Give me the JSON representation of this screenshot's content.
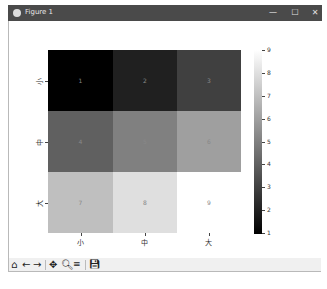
{
  "window": {
    "title": "Figure 1",
    "controls": {
      "minimize": "—",
      "maximize": "☐",
      "close": "✕"
    }
  },
  "chart_data": {
    "type": "heatmap",
    "title": "",
    "x_tick_labels": [
      "小",
      "中",
      "大"
    ],
    "y_tick_labels": [
      "小",
      "中",
      "大"
    ],
    "values": [
      [
        1,
        2,
        3
      ],
      [
        4,
        5,
        6
      ],
      [
        7,
        8,
        9
      ]
    ],
    "cell_labels": [
      [
        "1",
        "2",
        "3"
      ],
      [
        "4",
        "5",
        "6"
      ],
      [
        "7",
        "8",
        "9"
      ]
    ],
    "colormap": "gray",
    "colorbar": {
      "min": 1,
      "max": 9,
      "ticks": [
        "1",
        "2",
        "3",
        "4",
        "5",
        "6",
        "7",
        "8",
        "9"
      ]
    },
    "cell_colors": [
      [
        "#000000",
        "#202020",
        "#404040"
      ],
      [
        "#606060",
        "#808080",
        "#9f9f9f"
      ],
      [
        "#bfbfbf",
        "#dfdfdf",
        "#ffffff"
      ]
    ]
  },
  "toolbar": {
    "home": "home-icon",
    "back": "back-arrow-icon",
    "forward": "forward-arrow-icon",
    "pan": "pan-icon",
    "zoom": "zoom-icon",
    "configure": "subplots-icon",
    "save": "save-icon"
  }
}
